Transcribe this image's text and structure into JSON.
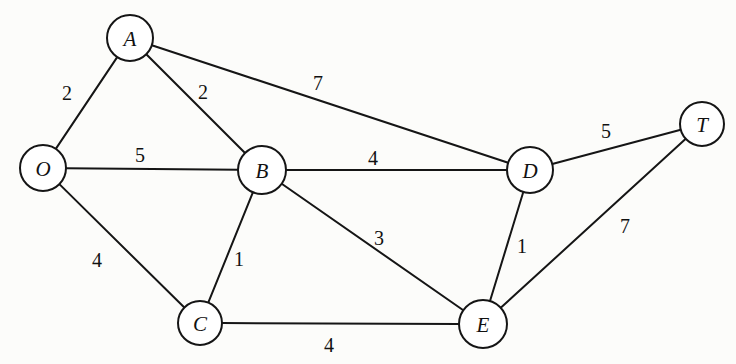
{
  "diagram": {
    "type": "weighted-undirected-graph",
    "title": "",
    "canvas": {
      "width": 736,
      "height": 364
    },
    "style": {
      "background_color": "#fcfcfa",
      "stroke_color": "#151515",
      "node_fill_color": "#ffffff",
      "label_color": "#111111"
    },
    "nodes": [
      {
        "id": "A",
        "label": "A",
        "x": 130,
        "y": 38,
        "r": 23
      },
      {
        "id": "O",
        "label": "O",
        "x": 43,
        "y": 168,
        "r": 23
      },
      {
        "id": "B",
        "label": "B",
        "x": 262,
        "y": 170,
        "r": 24
      },
      {
        "id": "D",
        "label": "D",
        "x": 530,
        "y": 170,
        "r": 23
      },
      {
        "id": "T",
        "label": "T",
        "x": 702,
        "y": 124,
        "r": 22
      },
      {
        "id": "C",
        "label": "C",
        "x": 200,
        "y": 323,
        "r": 22
      },
      {
        "id": "E",
        "label": "E",
        "x": 483,
        "y": 324,
        "r": 24
      }
    ],
    "edges": [
      {
        "id": "O-A",
        "from": "O",
        "to": "A",
        "weight": "2",
        "label_x": 67,
        "label_y": 93
      },
      {
        "id": "A-B",
        "from": "A",
        "to": "B",
        "weight": "2",
        "label_x": 203,
        "label_y": 92
      },
      {
        "id": "A-D",
        "from": "A",
        "to": "D",
        "weight": "7",
        "label_x": 318,
        "label_y": 83
      },
      {
        "id": "O-B",
        "from": "O",
        "to": "B",
        "weight": "5",
        "label_x": 140,
        "label_y": 155
      },
      {
        "id": "B-D",
        "from": "B",
        "to": "D",
        "weight": "4",
        "label_x": 373,
        "label_y": 158
      },
      {
        "id": "D-T",
        "from": "D",
        "to": "T",
        "weight": "5",
        "label_x": 606,
        "label_y": 131
      },
      {
        "id": "B-E",
        "from": "B",
        "to": "E",
        "weight": "3",
        "label_x": 379,
        "label_y": 238
      },
      {
        "id": "D-E",
        "from": "D",
        "to": "E",
        "weight": "1",
        "label_x": 522,
        "label_y": 246
      },
      {
        "id": "E-T",
        "from": "E",
        "to": "T",
        "weight": "7",
        "label_x": 625,
        "label_y": 226
      },
      {
        "id": "O-C",
        "from": "O",
        "to": "C",
        "weight": "4",
        "label_x": 97,
        "label_y": 260
      },
      {
        "id": "B-C",
        "from": "B",
        "to": "C",
        "weight": "1",
        "label_x": 239,
        "label_y": 259
      },
      {
        "id": "C-E",
        "from": "C",
        "to": "E",
        "weight": "4",
        "label_x": 329,
        "label_y": 345
      }
    ]
  }
}
